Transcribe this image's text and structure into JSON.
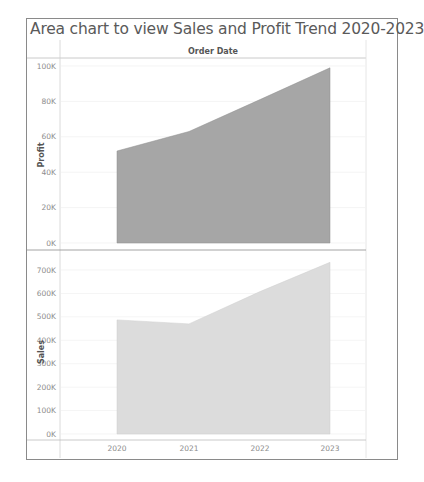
{
  "title": "Area chart to view Sales and Profit Trend 2020-2023",
  "column_header": "Order Date",
  "colors": {
    "profit_fill": "#a6a6a6",
    "sales_fill": "#dcdcdc",
    "frame": "#8a8a8a",
    "gridline": "#ececec",
    "text": "#8c8c8c"
  },
  "chart_data": [
    {
      "type": "area",
      "title": "Area chart to view Sales and Profit Trend 2020-2023",
      "xlabel": "Order Date",
      "ylabel": "Profit",
      "x": [
        "2020",
        "2021",
        "2022",
        "2023"
      ],
      "series": [
        {
          "name": "Profit",
          "values": [
            52000,
            63000,
            81000,
            99000
          ]
        }
      ],
      "ylim": [
        0,
        100000
      ],
      "yticks": [
        "0K",
        "20K",
        "40K",
        "60K",
        "80K",
        "100K"
      ],
      "grid": true,
      "legend": "none"
    },
    {
      "type": "area",
      "xlabel": "Order Date",
      "ylabel": "Sales",
      "x": [
        "2020",
        "2021",
        "2022",
        "2023"
      ],
      "series": [
        {
          "name": "Sales",
          "values": [
            487000,
            470000,
            608000,
            733000
          ]
        }
      ],
      "ylim": [
        0,
        700000
      ],
      "yticks": [
        "0K",
        "100K",
        "200K",
        "300K",
        "400K",
        "500K",
        "600K",
        "700K"
      ],
      "grid": true,
      "legend": "none"
    }
  ],
  "profit_axis": {
    "label": "Profit",
    "ticks": [
      "100K",
      "80K",
      "60K",
      "40K",
      "20K",
      "0K"
    ]
  },
  "sales_axis": {
    "label": "Sales",
    "ticks": [
      "700K",
      "600K",
      "500K",
      "400K",
      "300K",
      "200K",
      "100K",
      "0K"
    ]
  },
  "x_axis": {
    "ticks": [
      "2020",
      "2021",
      "2022",
      "2023"
    ]
  }
}
